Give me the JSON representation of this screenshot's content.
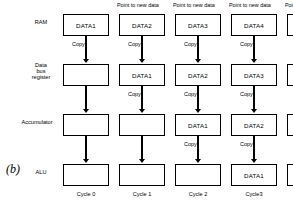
{
  "figure": {
    "label": "(b)",
    "caption_note": "Point to new data"
  },
  "row_labels": [
    {
      "id": "ram",
      "lines": [
        "RAM"
      ]
    },
    {
      "id": "data-bus-register",
      "lines": [
        "Data",
        "bus",
        "register"
      ]
    },
    {
      "id": "accumulator",
      "lines": [
        "Accumulator"
      ]
    },
    {
      "id": "alu",
      "lines": [
        "ALU"
      ]
    }
  ],
  "pointer_labels": [
    {
      "col": 2,
      "text": "Point to new data"
    },
    {
      "col": 3,
      "text": "Point to new data"
    },
    {
      "col": 4,
      "text": "Point to new data"
    },
    {
      "col": 5,
      "text": "Point to new data"
    }
  ],
  "columns": [
    {
      "cycle": "Cycle 0",
      "cells": {
        "ram": "DATA1",
        "data_bus_register": "",
        "accumulator": "",
        "alu": ""
      },
      "copy_labels": {
        "ram_to_dbr": "Copy",
        "dbr_to_acc": "",
        "acc_to_alu": ""
      }
    },
    {
      "cycle": "Cycle 1",
      "cells": {
        "ram": "DATA2",
        "data_bus_register": "DATA1",
        "accumulator": "",
        "alu": ""
      },
      "copy_labels": {
        "ram_to_dbr": "Copy",
        "dbr_to_acc": "Copy",
        "acc_to_alu": ""
      }
    },
    {
      "cycle": "Cycle 2",
      "cells": {
        "ram": "DATA3",
        "data_bus_register": "DATA2",
        "accumulator": "DATA1",
        "alu": ""
      },
      "copy_labels": {
        "ram_to_dbr": "Copy",
        "dbr_to_acc": "Copy",
        "acc_to_alu": "Copy"
      }
    },
    {
      "cycle": "Cycle3",
      "cells": {
        "ram": "DATA4",
        "data_bus_register": "DATA3",
        "accumulator": "DATA2",
        "alu": "DATA1"
      },
      "copy_labels": {
        "ram_to_dbr": "Copy",
        "dbr_to_acc": "Copy",
        "acc_to_alu": "Copy"
      }
    },
    {
      "cycle": "Cycle4",
      "cells": {
        "ram": "DATA5",
        "data_bus_register": "DATA4",
        "accumulator": "DATA3",
        "alu": "DATA2"
      },
      "copy_labels": {
        "ram_to_dbr": "Copy",
        "dbr_to_acc": "Copy",
        "acc_to_alu": "Copy"
      }
    }
  ],
  "colors": {
    "stroke": "#000000",
    "background": "#ffffff"
  }
}
